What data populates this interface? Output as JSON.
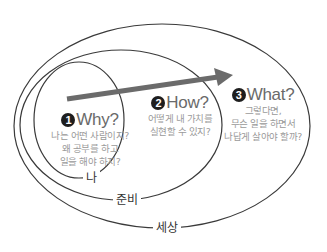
{
  "diagram": {
    "type": "nested-ellipses",
    "rings": [
      {
        "id": "inner",
        "label": "나"
      },
      {
        "id": "middle",
        "label": "준비"
      },
      {
        "id": "outer",
        "label": "세상"
      }
    ],
    "stages": [
      {
        "number": "1",
        "title": "Why?",
        "lines": [
          "나는 어떤 사람이지?",
          "왜 공부를 하고",
          "일을 해야 하지?"
        ]
      },
      {
        "number": "2",
        "title": "How?",
        "lines": [
          "어떻게 내 가치를",
          "실현할 수 있지?"
        ]
      },
      {
        "number": "3",
        "title": "What?",
        "lines": [
          "그렇다면,",
          "무슨 일을 하면서",
          "나답게 살아야 할까?"
        ]
      }
    ],
    "arrow": {
      "direction": "right-up",
      "color": "#6b6b6b"
    },
    "colors": {
      "line": "#3a3a3a",
      "heading": "#6a6a6a",
      "subtext": "#9a9a9a",
      "badge": "#1e1e1e"
    }
  }
}
